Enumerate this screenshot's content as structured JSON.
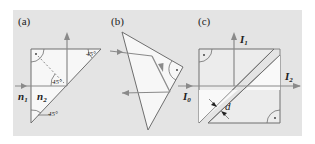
{
  "figure": {
    "background_color": "#e4e4e4",
    "prism_fill": "#f7f7f7",
    "line_color": "#6e6e6e",
    "ray_color": "#8a8a8a",
    "panels": [
      {
        "label": "(a)",
        "refractive_outer": "n",
        "refractive_outer_sub": "1",
        "refractive_inner": "n",
        "refractive_inner_sub": "2",
        "angle_top_right": "45°",
        "angle_inner": "45°",
        "angle_bottom": "45°"
      },
      {
        "label": "(b)"
      },
      {
        "label": "(c)",
        "input_intensity": "I",
        "input_sub": "0",
        "output_up": "I",
        "output_up_sub": "1",
        "output_right": "I",
        "output_right_sub": "2",
        "gap_label": "d"
      }
    ]
  }
}
